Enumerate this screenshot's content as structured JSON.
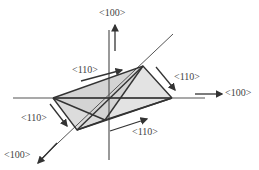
{
  "figure": {
    "axes": {
      "vertical": {
        "label": "<100>"
      },
      "horizontal": {
        "label": "<100>"
      },
      "diagonal": {
        "label": "<100>"
      }
    },
    "edge_labels": {
      "top_left": "<110>",
      "top_right": "<110>",
      "bottom_left": "<110>",
      "bottom_right": "<110>"
    },
    "colors": {
      "line": "#333333",
      "fill": "#d9d9d9",
      "text": "#444444"
    }
  }
}
